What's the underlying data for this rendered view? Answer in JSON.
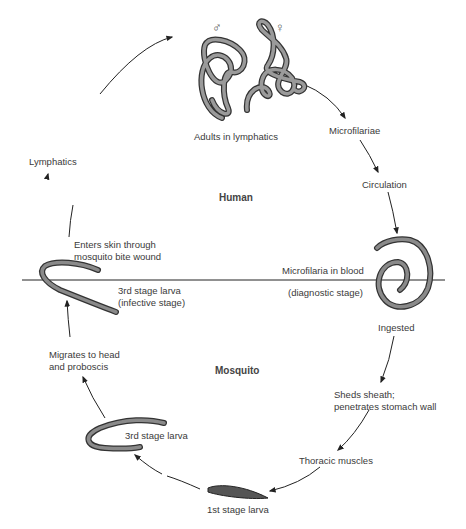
{
  "regions": {
    "top": "Human",
    "bottom": "Mosquito"
  },
  "symbols": {
    "male": "♂",
    "female": "♀"
  },
  "stages": {
    "adults": "Adults in lymphatics",
    "microfilariae": "Microfilariae",
    "circulation": "Circulation",
    "blood_1": "Microfilaria in blood",
    "blood_2": "(diagnostic stage)",
    "ingested": "Ingested",
    "sheds_1": "Sheds sheath;",
    "sheds_2": "penetrates stomach wall",
    "thoracic": "Thoracic muscles",
    "first_larva": "1st stage larva",
    "third_larva": "3rd stage larva",
    "migrates_1": "Migrates to head",
    "migrates_2": "and proboscis",
    "infective_1": "3rd stage larva",
    "infective_2": "(infective stage)",
    "enters_1": "Enters skin through",
    "enters_2": "mosquito bite wound",
    "lymphatics": "Lymphatics"
  },
  "colors": {
    "line": "#222222",
    "worm_fill": "#8a8a8a",
    "worm_edge": "#333333",
    "text": "#3a3a3a"
  }
}
